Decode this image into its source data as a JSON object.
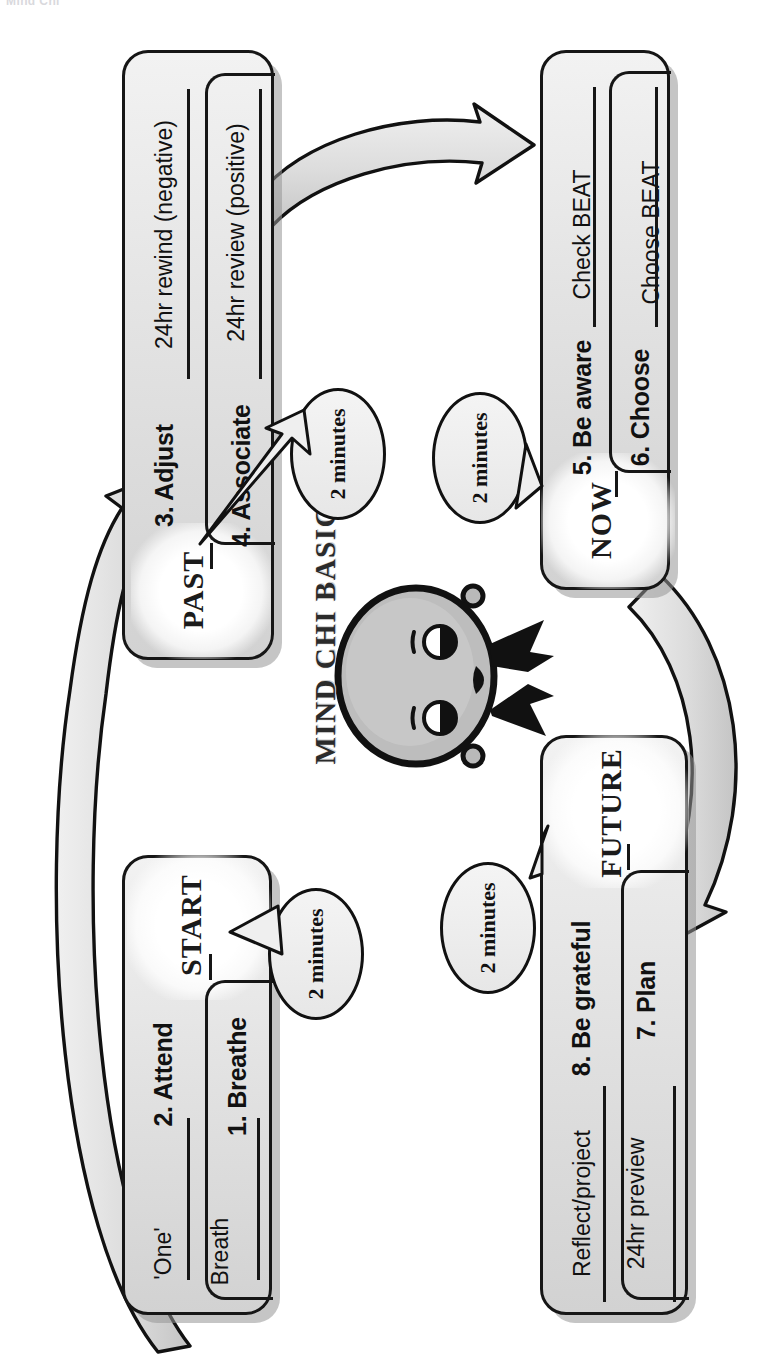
{
  "page": {
    "header_crop": "Mind Chi",
    "brand": "MIND CHI BASIC",
    "logo_icon": "mind-chi-head-icon",
    "background_color": "#ffffff",
    "card_border_color": "#161616",
    "card_fill_color": "#e6e6e6",
    "arrow_fill_color": "#dcdcdc"
  },
  "quadrants": [
    {
      "id": "past",
      "era": "PAST",
      "rows": [
        {
          "number_label": "3. Adjust",
          "detail": "24hr rewind (negative)"
        },
        {
          "number_label": "4. Associate",
          "detail": "24hr review (positive)"
        }
      ]
    },
    {
      "id": "now",
      "era": "NOW",
      "rows": [
        {
          "number_label": "5. Be aware",
          "detail": "Check BEAT"
        },
        {
          "number_label": "6. Choose",
          "detail": "Choose BEAT"
        }
      ]
    },
    {
      "id": "start",
      "era": "START",
      "rows": [
        {
          "number_label": "2. Attend",
          "detail": "'One'"
        },
        {
          "number_label": "1. Breathe",
          "detail": "Breath"
        }
      ]
    },
    {
      "id": "future",
      "era": "FUTURE",
      "rows": [
        {
          "number_label": "8. Be grateful",
          "detail": "Reflect/project"
        },
        {
          "number_label": "7. Plan",
          "detail": "24hr preview"
        }
      ]
    }
  ],
  "bubbles": [
    {
      "id": "bubble-past",
      "text": "2 minutes"
    },
    {
      "id": "bubble-now",
      "text": "2 minutes"
    },
    {
      "id": "bubble-start",
      "text": "2 minutes"
    },
    {
      "id": "bubble-future",
      "text": "2 minutes"
    }
  ],
  "arrows": [
    {
      "id": "arrow-past-to-now",
      "from": "PAST",
      "to": "NOW"
    },
    {
      "id": "arrow-now-to-future",
      "from": "NOW",
      "to": "FUTURE"
    },
    {
      "id": "arrow-future-to-past",
      "from": "FUTURE",
      "to": "PAST"
    }
  ]
}
